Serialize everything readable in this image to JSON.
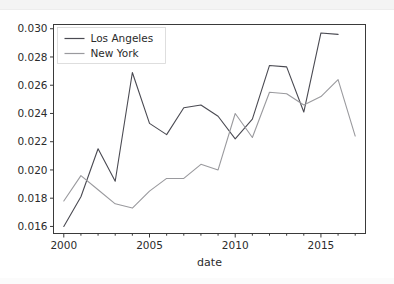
{
  "chart_data": {
    "type": "line",
    "title": "",
    "xlabel": "date",
    "ylabel": "",
    "xlim": [
      1999.4,
      2017.6
    ],
    "ylim": [
      0.0155,
      0.0303
    ],
    "grid": false,
    "legend_position": "upper left",
    "x": [
      2000,
      2001,
      2002,
      2003,
      2004,
      2005,
      2006,
      2007,
      2008,
      2009,
      2010,
      2011,
      2012,
      2013,
      2014,
      2015,
      2016,
      2017
    ],
    "xticks": [
      2000,
      2005,
      2010,
      2015
    ],
    "xticklabels": [
      "2000",
      "2005",
      "2010",
      "2015"
    ],
    "xminorticks": [
      2001,
      2002,
      2003,
      2004,
      2006,
      2007,
      2008,
      2009,
      2011,
      2012,
      2013,
      2014,
      2016,
      2017
    ],
    "yticks": [
      0.016,
      0.018,
      0.02,
      0.022,
      0.024,
      0.026,
      0.028,
      0.03
    ],
    "yticklabels": [
      "0.016",
      "0.018",
      "0.020",
      "0.022",
      "0.024",
      "0.026",
      "0.028",
      "0.030"
    ],
    "series": [
      {
        "name": "Los Angeles",
        "color": "#4a4a52",
        "x": [
          2000,
          2001,
          2002,
          2003,
          2004,
          2005,
          2006,
          2007,
          2008,
          2009,
          2010,
          2011,
          2012,
          2013,
          2014,
          2015,
          2016
        ],
        "values": [
          0.016,
          0.0181,
          0.0215,
          0.0192,
          0.0269,
          0.0233,
          0.0225,
          0.0244,
          0.0246,
          0.0238,
          0.0222,
          0.0236,
          0.0274,
          0.0273,
          0.0241,
          0.0297,
          0.0296
        ]
      },
      {
        "name": "New York",
        "color": "#9a9a9e",
        "x": [
          2000,
          2001,
          2002,
          2003,
          2004,
          2005,
          2006,
          2007,
          2008,
          2009,
          2010,
          2011,
          2012,
          2013,
          2014,
          2015,
          2016,
          2017
        ],
        "values": [
          0.0178,
          0.0196,
          0.0186,
          0.0176,
          0.0173,
          0.0185,
          0.0194,
          0.0194,
          0.0204,
          0.02,
          0.024,
          0.0223,
          0.0255,
          0.0254,
          0.0246,
          0.0252,
          0.0264,
          0.0224
        ]
      }
    ]
  },
  "legend": {
    "entries": [
      {
        "label": "Los Angeles"
      },
      {
        "label": "New York"
      }
    ]
  },
  "axes": {
    "xlabel": "date"
  }
}
